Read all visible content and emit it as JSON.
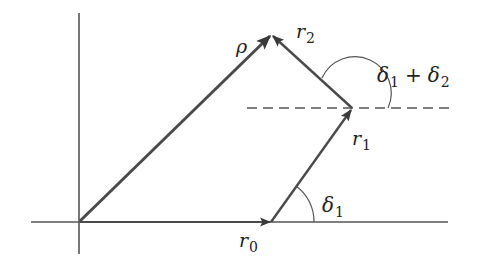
{
  "diagram": {
    "type": "vector-addition",
    "colors": {
      "line": "#555555",
      "vector": "#4a4a4a",
      "text": "#222222"
    },
    "labels": {
      "rho": "ρ",
      "r0": "r",
      "r0_sub": "0",
      "r1": "r",
      "r1_sub": "1",
      "r2": "r",
      "r2_sub": "2",
      "delta1": "δ",
      "delta1_sub": "1",
      "delta_sum_a": "δ",
      "delta_sum_a_sub": "1",
      "delta_sum_plus": "+",
      "delta_sum_b": "δ",
      "delta_sum_b_sub": "2"
    }
  }
}
